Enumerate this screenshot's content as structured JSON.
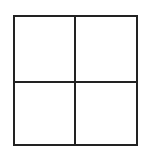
{
  "diagram": {
    "type": "grid",
    "rows": 2,
    "columns": 2,
    "cells": [
      {
        "row": 0,
        "col": 0,
        "label": ""
      },
      {
        "row": 0,
        "col": 1,
        "label": ""
      },
      {
        "row": 1,
        "col": 0,
        "label": ""
      },
      {
        "row": 1,
        "col": 1,
        "label": ""
      }
    ],
    "line_color": "#222222",
    "background": "#ffffff"
  }
}
